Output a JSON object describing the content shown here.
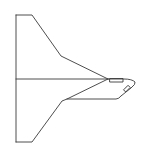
{
  "diagram": {
    "stroke_color": "#3a3a3a",
    "background_color": "#ffffff",
    "parts": [
      {
        "name": "upper-wing"
      },
      {
        "name": "lower-wing"
      },
      {
        "name": "center-line"
      },
      {
        "name": "nose"
      },
      {
        "name": "cockpit-window-upper"
      },
      {
        "name": "cockpit-window-lower"
      }
    ]
  }
}
